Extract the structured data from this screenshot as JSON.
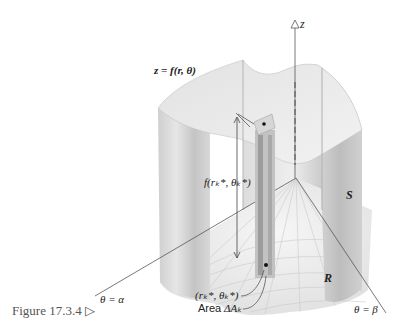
{
  "figure": {
    "caption": "Figure 17.3.4",
    "caption_marker": "▷",
    "labels": {
      "z_axis": "z",
      "surface": "z = f(r, θ)",
      "height": "f(rₖ*, θₖ*)",
      "solid_side": "S",
      "region": "R",
      "sample_point": "(rₖ*, θₖ*)",
      "area_prefix": "Area",
      "area_symbol": "ΔAₖ",
      "ray_alpha": "θ = α",
      "ray_beta": "θ = β"
    }
  }
}
